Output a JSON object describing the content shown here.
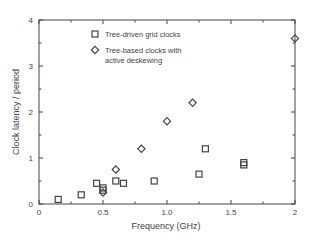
{
  "chart_data": {
    "type": "scatter",
    "title": "",
    "xlabel": "Frequency (GHz)",
    "ylabel": "Clock latency / period",
    "xlim": [
      0,
      2
    ],
    "ylim": [
      0,
      4
    ],
    "x_ticks": [
      "0",
      "0.5",
      "1.0",
      "1.5",
      "2"
    ],
    "x_tick_values": [
      0,
      0.5,
      1.0,
      1.5,
      2.0
    ],
    "y_ticks": [
      "0",
      "1",
      "2",
      "3",
      "4"
    ],
    "y_tick_values": [
      0,
      1,
      2,
      3,
      4
    ],
    "grid": false,
    "legend_position": "upper-left-inside",
    "series": [
      {
        "name": "Tree-driven grid clocks",
        "marker": "square",
        "points": [
          [
            0.15,
            0.1
          ],
          [
            0.33,
            0.2
          ],
          [
            0.45,
            0.45
          ],
          [
            0.5,
            0.3
          ],
          [
            0.5,
            0.35
          ],
          [
            0.6,
            0.5
          ],
          [
            0.66,
            0.45
          ],
          [
            0.9,
            0.5
          ],
          [
            1.25,
            0.65
          ],
          [
            1.3,
            1.2
          ],
          [
            1.6,
            0.85
          ],
          [
            1.6,
            0.9
          ]
        ]
      },
      {
        "name": "Tree-based clocks with active deskewing",
        "name_lines": [
          "Tree-based clocks with",
          "active deskewing"
        ],
        "marker": "diamond",
        "points": [
          [
            0.5,
            0.25
          ],
          [
            0.6,
            0.75
          ],
          [
            0.8,
            1.2
          ],
          [
            1.0,
            1.8
          ],
          [
            1.2,
            2.2
          ],
          [
            2.0,
            3.6
          ]
        ]
      }
    ]
  },
  "colors": {
    "axis": "#444444",
    "marker": "#444444",
    "background": "#ffffff"
  }
}
